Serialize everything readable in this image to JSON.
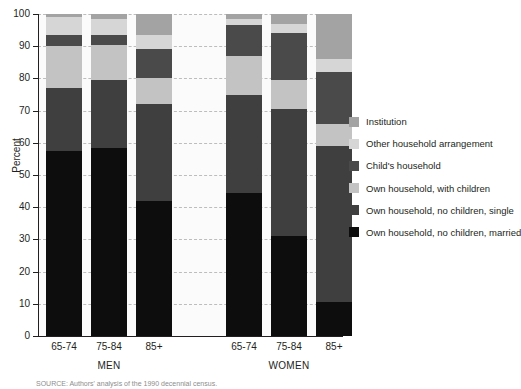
{
  "chart_data": {
    "type": "bar",
    "stacked": true,
    "title": "",
    "xlabel": "",
    "ylabel": "Percent",
    "ylim": [
      0,
      100
    ],
    "yticks": [
      0,
      10,
      20,
      30,
      40,
      50,
      60,
      70,
      80,
      90,
      100
    ],
    "grid": true,
    "legend_position": "right",
    "categories": [
      "65-74",
      "75-84",
      "85+",
      "65-74",
      "75-84",
      "85+"
    ],
    "groups": [
      {
        "name": "MEN",
        "categories": [
          "65-74",
          "75-84",
          "85+"
        ]
      },
      {
        "name": "WOMEN",
        "categories": [
          "65-74",
          "75-84",
          "85+"
        ]
      }
    ],
    "series": [
      {
        "name": "Own household, no children, married",
        "color": "#0d0d0d",
        "values": [
          57.5,
          58.5,
          42.0,
          44.5,
          31.0,
          10.5
        ]
      },
      {
        "name": "Own household, no children, single",
        "color": "#3f3f3f",
        "values": [
          19.5,
          21.0,
          30.0,
          30.5,
          39.5,
          48.5
        ]
      },
      {
        "name": "Own household, with children",
        "color": "#c3c3c3",
        "values": [
          13.0,
          11.0,
          8.0,
          12.0,
          9.0,
          7.0
        ]
      },
      {
        "name": "Child's household",
        "color": "#4a4a4a",
        "values": [
          3.5,
          3.0,
          9.0,
          9.5,
          14.5,
          16.0
        ]
      },
      {
        "name": "Other household arrangement",
        "color": "#d6d6d6",
        "values": [
          5.5,
          5.0,
          4.5,
          2.0,
          3.0,
          4.0
        ]
      },
      {
        "name": "Institution",
        "color": "#a3a3a3",
        "values": [
          1.0,
          1.5,
          6.5,
          1.5,
          3.0,
          14.0
        ]
      }
    ]
  },
  "legend": {
    "items": [
      {
        "label": "Institution",
        "color": "#a3a3a3"
      },
      {
        "label": "Other household arrangement",
        "color": "#d6d6d6"
      },
      {
        "label": "Child's household",
        "color": "#4a4a4a"
      },
      {
        "label": "Own household, with children",
        "color": "#c3c3c3"
      },
      {
        "label": "Own household, no children, single",
        "color": "#3f3f3f"
      },
      {
        "label": "Own household, no children, married",
        "color": "#0d0d0d"
      }
    ]
  },
  "source": {
    "text": "SOURCE: Authors' analysis of the 1990 decennial census."
  }
}
